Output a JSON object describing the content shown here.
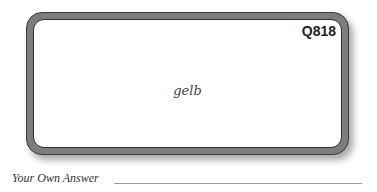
{
  "card": {
    "id": "Q818",
    "term": "gelb"
  },
  "answer": {
    "label": "Your Own Answer",
    "value": ""
  }
}
